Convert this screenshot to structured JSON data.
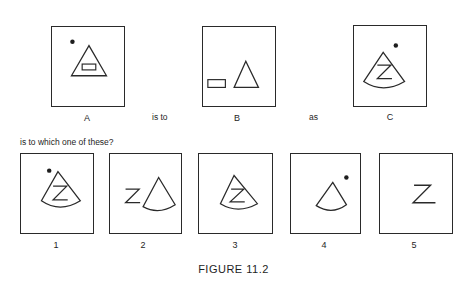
{
  "analogy": {
    "panels": [
      {
        "label": "A",
        "contents": [
          "dot",
          "triangle",
          "rectangle-inside-triangle"
        ]
      },
      {
        "label": "B",
        "contents": [
          "rectangle",
          "triangle"
        ]
      },
      {
        "label": "C",
        "contents": [
          "dot",
          "cone-sector",
          "letter-Z-inside-cone"
        ]
      }
    ],
    "connector_1": "is to",
    "connector_2": "as",
    "prompt": "is to which one of these?"
  },
  "options": [
    {
      "label": "1",
      "contents": [
        "dot",
        "cone-sector",
        "letter-Z-inside-cone"
      ]
    },
    {
      "label": "2",
      "contents": [
        "letter-Z",
        "cone-sector"
      ]
    },
    {
      "label": "3",
      "contents": [
        "cone-sector",
        "letter-Z-inside-cone"
      ]
    },
    {
      "label": "4",
      "contents": [
        "cone-sector",
        "dot"
      ]
    },
    {
      "label": "5",
      "contents": [
        "letter-Z"
      ]
    }
  ],
  "glyph": {
    "letter": "Z"
  },
  "caption": "FIGURE 11.2",
  "colors": {
    "ink": "#2a2a2a",
    "background": "#ffffff"
  }
}
